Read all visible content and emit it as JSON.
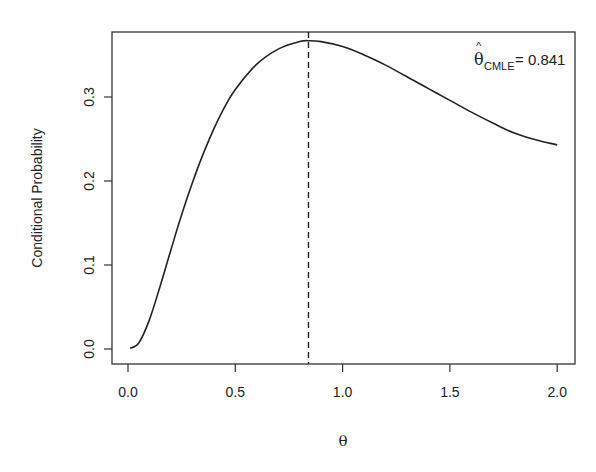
{
  "chart_data": {
    "type": "line",
    "title": "",
    "xlabel": "θ",
    "ylabel": "Conditional Probability",
    "xlim": [
      -0.04,
      2.06
    ],
    "ylim": [
      -0.018,
      0.378
    ],
    "x_ticks": [
      0.0,
      0.5,
      1.0,
      1.5,
      2.0
    ],
    "x_tick_labels": [
      "0.0",
      "0.5",
      "1.0",
      "1.5",
      "2.0"
    ],
    "y_ticks": [
      0.0,
      0.1,
      0.2,
      0.3
    ],
    "y_tick_labels": [
      "0.0",
      "0.1",
      "0.2",
      "0.3"
    ],
    "grid": false,
    "legend": null,
    "series": [
      {
        "name": "Conditional Probability",
        "x": [
          0.01,
          0.05,
          0.1,
          0.15,
          0.2,
          0.25,
          0.3,
          0.35,
          0.4,
          0.45,
          0.5,
          0.6,
          0.7,
          0.8,
          0.841,
          0.9,
          1.0,
          1.1,
          1.2,
          1.3,
          1.4,
          1.5,
          1.6,
          1.7,
          1.8,
          1.9,
          2.0
        ],
        "y": [
          0.001,
          0.007,
          0.035,
          0.075,
          0.118,
          0.16,
          0.198,
          0.232,
          0.262,
          0.288,
          0.309,
          0.339,
          0.357,
          0.366,
          0.367,
          0.366,
          0.36,
          0.35,
          0.338,
          0.324,
          0.31,
          0.296,
          0.282,
          0.269,
          0.257,
          0.249,
          0.243
        ]
      }
    ],
    "annotations": [
      {
        "type": "vline",
        "x": 0.841,
        "style": "dashed"
      },
      {
        "type": "text",
        "label_symbol": "θ̂",
        "label_subscript": "CMLE",
        "label_value": "= 0.841",
        "position": "top-right"
      }
    ]
  },
  "axes": {
    "xlabel": "θ",
    "ylabel": "Conditional Probability",
    "x_tick_labels": [
      "0.0",
      "0.5",
      "1.0",
      "1.5",
      "2.0"
    ],
    "y_tick_labels": [
      "0.0",
      "0.1",
      "0.2",
      "0.3"
    ]
  },
  "annotation": {
    "symbol": "θ",
    "hat": "^",
    "subscript": "CMLE",
    "value_text": "= 0.841"
  }
}
